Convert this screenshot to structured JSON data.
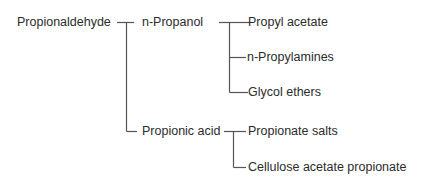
{
  "diagram": {
    "type": "tree",
    "title": "",
    "root": {
      "label": "Propionaldehyde",
      "children": [
        {
          "label": "n-Propanol",
          "children": [
            {
              "label": "Propyl acetate"
            },
            {
              "label": "n-Propylamines"
            },
            {
              "label": "Glycol ethers"
            }
          ]
        },
        {
          "label": "Propionic acid",
          "children": [
            {
              "label": "Propionate salts"
            },
            {
              "label": "Cellulose acetate propionate"
            }
          ]
        }
      ]
    },
    "colors": {
      "text": "#2b2b2b",
      "line": "#555555",
      "background": "#ffffff"
    }
  },
  "nodes": {
    "root": "Propionaldehyde",
    "n_propanol": "n-Propanol",
    "propyl_acetate": "Propyl acetate",
    "n_propylamines": "n-Propylamines",
    "glycol_ethers": "Glycol ethers",
    "propionic_acid": "Propionic acid",
    "propionate_salts": "Propionate salts",
    "cellulose_acetate_propionate": "Cellulose acetate propionate"
  }
}
